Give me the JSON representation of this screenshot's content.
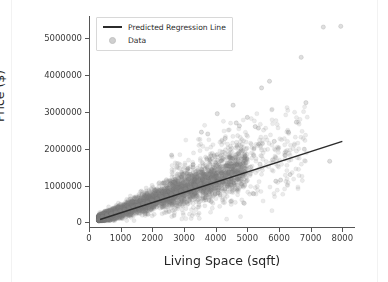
{
  "chart_data": {
    "type": "scatter",
    "title": "",
    "xlabel": "Living Space (sqft)",
    "ylabel": "Price ($)",
    "xlim": [
      0,
      8400
    ],
    "ylim": [
      -150000,
      5600000
    ],
    "grid": false,
    "legend_position": "upper left",
    "xticks": [
      0,
      1000,
      2000,
      3000,
      4000,
      5000,
      6000,
      7000,
      8000
    ],
    "xticklabels": [
      "0",
      "1000",
      "2000",
      "3000",
      "4000",
      "5000",
      "6000",
      "7000",
      "8000"
    ],
    "yticks": [
      0,
      1000000,
      2000000,
      3000000,
      4000000,
      5000000
    ],
    "yticklabels": [
      "0",
      "1000000",
      "2000000",
      "3000000",
      "4000000",
      "5000000"
    ],
    "marker_color": "#808080",
    "marker_alpha": 0.18,
    "marker_size": 4.2,
    "line_color": "#2b2b2b",
    "series": [
      {
        "name": "Predicted Regression Line",
        "type": "line",
        "x": [
          350,
          8000
        ],
        "y": [
          80000,
          2200000
        ],
        "slope": 277.1,
        "intercept": -17000
      },
      {
        "name": "Data",
        "type": "scatter",
        "n_points": 4600,
        "description": "Dense fan-shaped cloud of house records widening with living space; core band runs from about (400 sqft, 120000 $) to (4500 sqft, 1100000 $), with a sparse upper tail of high-price outliers reaching 5300000 $ near 7400-8000 sqft.",
        "x_range": [
          300,
          8000
        ],
        "y_range": [
          50000,
          5300000
        ],
        "sample_points": [
          [
            420,
            150000
          ],
          [
            560,
            190000
          ],
          [
            700,
            230000
          ],
          [
            850,
            270000
          ],
          [
            980,
            300000
          ],
          [
            1120,
            340000
          ],
          [
            1260,
            380000
          ],
          [
            1400,
            420000
          ],
          [
            1550,
            460000
          ],
          [
            1700,
            500000
          ],
          [
            1850,
            540000
          ],
          [
            2000,
            590000
          ],
          [
            2150,
            630000
          ],
          [
            2300,
            680000
          ],
          [
            2450,
            720000
          ],
          [
            2600,
            770000
          ],
          [
            2750,
            810000
          ],
          [
            2900,
            860000
          ],
          [
            3050,
            900000
          ],
          [
            3200,
            950000
          ],
          [
            3350,
            1000000
          ],
          [
            3500,
            1040000
          ],
          [
            3700,
            1100000
          ],
          [
            3900,
            1160000
          ],
          [
            4100,
            1220000
          ],
          [
            4300,
            1280000
          ],
          [
            4500,
            1340000
          ],
          [
            4800,
            1420000
          ],
          [
            5100,
            1500000
          ],
          [
            5400,
            1580000
          ],
          [
            5800,
            1700000
          ],
          [
            6200,
            1820000
          ],
          [
            3550,
            2450000
          ],
          [
            3750,
            2400000
          ],
          [
            4050,
            2950000
          ],
          [
            4300,
            2280000
          ],
          [
            4550,
            3180000
          ],
          [
            4650,
            2700000
          ],
          [
            4750,
            2620000
          ],
          [
            5000,
            2850000
          ],
          [
            5250,
            2600000
          ],
          [
            5450,
            3650000
          ],
          [
            5700,
            3830000
          ],
          [
            5850,
            2200000
          ],
          [
            6300,
            2450000
          ],
          [
            6550,
            2720000
          ],
          [
            6700,
            4480000
          ],
          [
            6850,
            3250000
          ],
          [
            7400,
            5300000
          ],
          [
            7950,
            5320000
          ],
          [
            7600,
            1660000
          ],
          [
            6050,
            1150000
          ],
          [
            5900,
            1120000
          ],
          [
            4900,
            520000
          ],
          [
            5200,
            780000
          ],
          [
            6350,
            1300000
          ]
        ]
      }
    ]
  },
  "legend": {
    "entries": [
      {
        "label": "Predicted Regression Line",
        "key": "line-key"
      },
      {
        "label": "Data",
        "key": "dot-key"
      }
    ]
  },
  "axis": {
    "x_label": "Living Space (sqft)",
    "y_label": "Price ($)"
  },
  "colors": {
    "marker": "#808080",
    "line": "#2b2b2b",
    "spine": "#555555",
    "text": "#262626",
    "background": "#ffffff"
  }
}
